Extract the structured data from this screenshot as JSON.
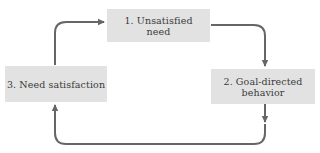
{
  "diagram": {
    "type": "cycle",
    "colors": {
      "box_fill": "#e2e2e2",
      "arrow": "#666666",
      "text": "#3a3a3a",
      "background": "#ffffff"
    },
    "nodes": [
      {
        "id": "1",
        "lines": [
          "1. Unsatisfied",
          "need"
        ]
      },
      {
        "id": "2",
        "lines": [
          "2. Goal-directed",
          "behavior"
        ]
      },
      {
        "id": "3",
        "lines": [
          "3. Need satisfaction"
        ]
      }
    ],
    "edges": [
      {
        "from": "1",
        "to": "2",
        "icon": "arrow-right-down-icon"
      },
      {
        "from": "2",
        "to": "3",
        "icon": "arrow-down-left-up-icon"
      },
      {
        "from": "3",
        "to": "1",
        "icon": "arrow-up-right-icon"
      }
    ]
  }
}
